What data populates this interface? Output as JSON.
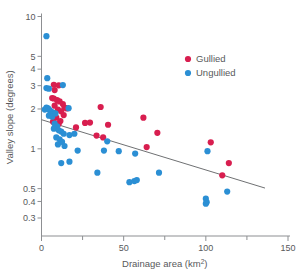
{
  "chart_data": {
    "type": "scatter",
    "title": "",
    "xlabel": "Drainage area (km2)",
    "xlabel_main": "Drainage area (km",
    "xlabel_sup": "2",
    "xlabel_close": ")",
    "ylabel": "Valley slope (degrees)",
    "xlim": [
      0,
      150
    ],
    "ylim": [
      0.27,
      11
    ],
    "yscale": "log",
    "xscale": "linear",
    "grid": false,
    "xticks": [
      0,
      50,
      100,
      150
    ],
    "xticks_minor": [
      25,
      75,
      125
    ],
    "xtick_labels": [
      "0",
      "50",
      "100",
      "150"
    ],
    "yticks": [
      10,
      5,
      4,
      3,
      2,
      1,
      0.5,
      0.4,
      0.3
    ],
    "ytick_labels": [
      "10",
      "5",
      "4",
      "3",
      "2",
      "1",
      "0.5",
      "0.4",
      "0.3"
    ],
    "legend_position": "upper right",
    "colors": {
      "gullied": "#d81e4f",
      "ungullied": "#2b8fd4",
      "axis": "#8d8f92",
      "text": "#58595b",
      "trendline": "#6f7173"
    },
    "series": [
      {
        "name": "Gullied",
        "color": "#d81e4f",
        "points": [
          [
            7.5,
            3.05
          ],
          [
            10.5,
            3.02
          ],
          [
            8.0,
            2.78
          ],
          [
            6.5,
            2.42
          ],
          [
            7.5,
            2.4
          ],
          [
            9.5,
            2.33
          ],
          [
            11.0,
            2.28
          ],
          [
            8.0,
            2.12
          ],
          [
            13.0,
            2.18
          ],
          [
            14.0,
            2.05
          ],
          [
            15.5,
            2.02
          ],
          [
            10.0,
            1.98
          ],
          [
            12.0,
            1.92
          ],
          [
            13.5,
            1.8
          ],
          [
            9.0,
            1.72
          ],
          [
            11.5,
            1.62
          ],
          [
            7.0,
            1.6
          ],
          [
            10.5,
            1.55
          ],
          [
            21.0,
            1.45
          ],
          [
            26.5,
            1.57
          ],
          [
            29.5,
            1.58
          ],
          [
            36.0,
            2.07
          ],
          [
            40.5,
            1.52
          ],
          [
            33.5,
            1.26
          ],
          [
            37.5,
            1.22
          ],
          [
            62.0,
            1.72
          ],
          [
            70.5,
            1.32
          ],
          [
            64.0,
            1.03
          ],
          [
            103.0,
            1.12
          ],
          [
            110.0,
            0.63
          ],
          [
            114.0,
            0.78
          ]
        ]
      },
      {
        "name": "Ungullied",
        "color": "#2b8fd4",
        "points": [
          [
            3.0,
            7.1
          ],
          [
            3.5,
            3.42
          ],
          [
            3.0,
            2.88
          ],
          [
            4.5,
            2.85
          ],
          [
            13.0,
            3.03
          ],
          [
            2.0,
            1.98
          ],
          [
            3.0,
            2.05
          ],
          [
            4.0,
            2.02
          ],
          [
            5.0,
            1.96
          ],
          [
            6.0,
            1.9
          ],
          [
            7.0,
            1.88
          ],
          [
            5.5,
            1.82
          ],
          [
            4.5,
            1.78
          ],
          [
            6.5,
            1.75
          ],
          [
            8.5,
            1.85
          ],
          [
            16.5,
            2.03
          ],
          [
            8.0,
            1.55
          ],
          [
            9.5,
            1.48
          ],
          [
            7.5,
            1.42
          ],
          [
            10.5,
            1.38
          ],
          [
            12.0,
            1.35
          ],
          [
            13.5,
            1.3
          ],
          [
            17.0,
            1.27
          ],
          [
            20.0,
            1.3
          ],
          [
            9.0,
            1.22
          ],
          [
            11.0,
            1.18
          ],
          [
            12.5,
            1.13
          ],
          [
            10.0,
            1.08
          ],
          [
            14.0,
            1.05
          ],
          [
            22.0,
            0.97
          ],
          [
            12.0,
            0.78
          ],
          [
            17.0,
            0.8
          ],
          [
            38.0,
            0.97
          ],
          [
            40.0,
            1.14
          ],
          [
            47.0,
            0.96
          ],
          [
            57.0,
            0.92
          ],
          [
            34.0,
            0.66
          ],
          [
            53.5,
            0.56
          ],
          [
            56.5,
            0.57
          ],
          [
            58.0,
            0.58
          ],
          [
            71.5,
            0.66
          ],
          [
            101.0,
            0.96
          ],
          [
            100.0,
            0.42
          ],
          [
            100.5,
            0.395
          ],
          [
            100.0,
            0.385
          ],
          [
            113.0,
            0.475
          ]
        ]
      }
    ],
    "trend_line": {
      "x_start": 0,
      "y_start": 1.66,
      "x_end": 136,
      "y_end": 0.505
    }
  },
  "legend": {
    "items": [
      {
        "label": "Gullied",
        "color": "#d81e4f"
      },
      {
        "label": "Ungullied",
        "color": "#2b8fd4"
      }
    ]
  }
}
